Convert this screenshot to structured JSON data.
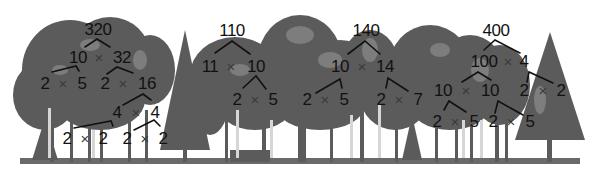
{
  "colors": {
    "background": "#ffffff",
    "tree_silhouette": "#5a5a5a",
    "tree_light": "#8a8a8a",
    "tree_highlight": "#d8d8d8",
    "text": "#111111",
    "lines": "#111111"
  },
  "operator_symbol": "×",
  "factor_trees": [
    {
      "root": "320",
      "rows": [
        [
          "10",
          "32"
        ],
        [
          "2",
          "5",
          "2",
          "16"
        ],
        [
          "4",
          "4"
        ],
        [
          "2",
          "2",
          "2",
          "2"
        ]
      ],
      "nodes": {
        "n320": "320",
        "n10": "10",
        "n32": "32",
        "n10a": "2",
        "n10b": "5",
        "n32a": "2",
        "n32b": "16",
        "n16a": "4",
        "n16b": "4",
        "n4aa": "2",
        "n4ab": "2",
        "n4ba": "2",
        "n4bb": "2"
      }
    },
    {
      "root": "110",
      "rows": [
        [
          "11",
          "10"
        ],
        [
          "2",
          "5"
        ]
      ],
      "nodes": {
        "n110": "110",
        "n11": "11",
        "n10": "10",
        "n10a": "2",
        "n10b": "5"
      }
    },
    {
      "root": "140",
      "rows": [
        [
          "10",
          "14"
        ],
        [
          "2",
          "5",
          "2",
          "7"
        ]
      ],
      "nodes": {
        "n140": "140",
        "n10": "10",
        "n14": "14",
        "n10a": "2",
        "n10b": "5",
        "n14a": "2",
        "n14b": "7"
      }
    },
    {
      "root": "400",
      "rows": [
        [
          "100",
          "4"
        ],
        [
          "10",
          "10",
          "2",
          "2"
        ],
        [
          "2",
          "5",
          "2",
          "5"
        ]
      ],
      "nodes": {
        "n400": "400",
        "n100": "100",
        "n4": "4",
        "n100a": "10",
        "n100b": "10",
        "n4a": "2",
        "n4b": "2",
        "n10aa": "2",
        "n10ab": "5",
        "n10ba": "2",
        "n10bb": "5"
      }
    }
  ]
}
